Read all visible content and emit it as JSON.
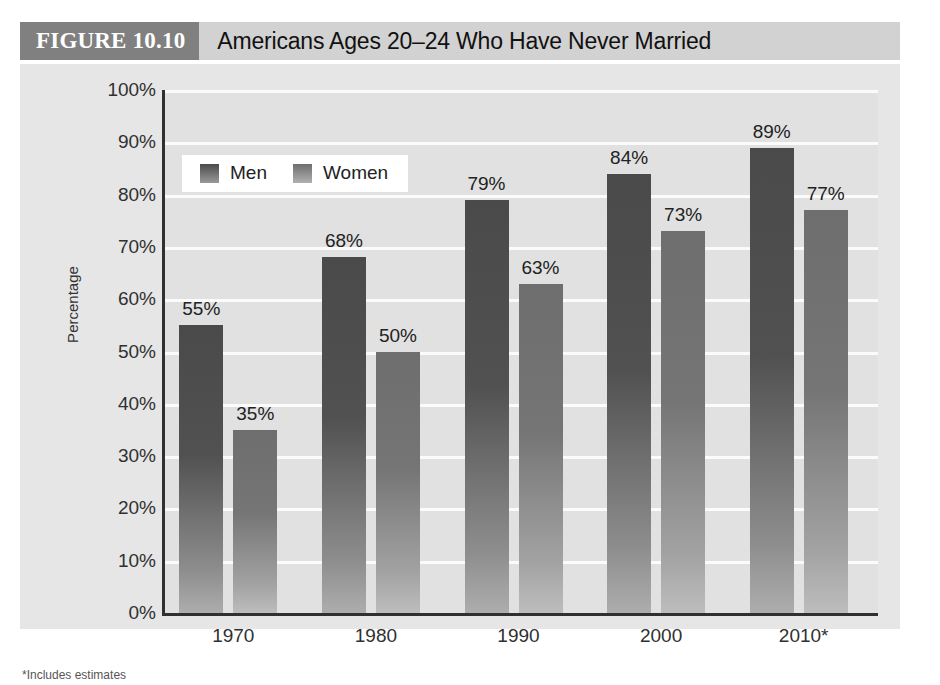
{
  "header": {
    "figure_tag": "FIGURE 10.10",
    "title": "Americans Ages 20–24 Who Have Never Married",
    "tag_bg": "#808080",
    "bar_bg": "#d2d2d2"
  },
  "legend": {
    "position": "top-left-inside",
    "items": [
      {
        "label": "Men",
        "color": "#4a4a4a"
      },
      {
        "label": "Women",
        "color": "#6e6e6e"
      }
    ]
  },
  "footnote": {
    "text": "*Includes estimates"
  },
  "chart_data": {
    "type": "bar",
    "title": "Americans Ages 20–24 Who Have Never Married",
    "xlabel": "",
    "ylabel": "Percentage",
    "categories": [
      "1970",
      "1980",
      "1990",
      "2000",
      "2010*"
    ],
    "series": [
      {
        "name": "Men",
        "values": [
          55,
          68,
          79,
          84,
          89
        ],
        "color": "#4a4a4a"
      },
      {
        "name": "Women",
        "values": [
          35,
          50,
          63,
          73,
          77
        ],
        "color": "#6e6e6e"
      }
    ],
    "data_labels": {
      "Men": [
        "55%",
        "68%",
        "79%",
        "84%",
        "89%"
      ],
      "Women": [
        "35%",
        "50%",
        "63%",
        "73%",
        "77%"
      ]
    },
    "ylim": [
      0,
      100
    ],
    "ytick_values": [
      0,
      10,
      20,
      30,
      40,
      50,
      60,
      70,
      80,
      90,
      100
    ],
    "ytick_labels": [
      "0%",
      "10%",
      "20%",
      "30%",
      "40%",
      "50%",
      "60%",
      "70%",
      "80%",
      "90%",
      "100%"
    ],
    "grid": true,
    "grid_color": "#fbfbfb",
    "plot_bg": "#e1e1e1",
    "panel_bg": "#e6e6e6",
    "legend_position": "inside top-left"
  }
}
